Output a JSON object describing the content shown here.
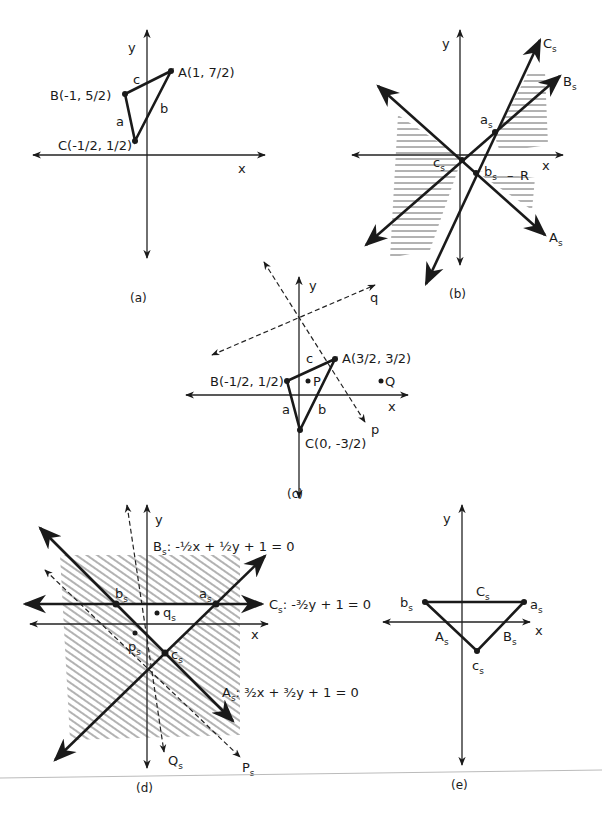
{
  "panels": {
    "a": {
      "caption": "(a)",
      "axis_x": "x",
      "axis_y": "y",
      "points": {
        "A": "A(1, 7/2)",
        "B": "B(-1, 5/2)",
        "C": "C(-1/2, 1/2)"
      },
      "sides": {
        "a": "a",
        "b": "b",
        "c": "c"
      }
    },
    "b": {
      "caption": "(b)",
      "axis_x": "x",
      "axis_y": "y",
      "lines": {
        "As": "A",
        "Bs": "B",
        "Cs": "C",
        "sub": "s"
      },
      "points": {
        "as": "a",
        "bs": "b",
        "cs": "c",
        "sub": "s"
      },
      "region": "R"
    },
    "c": {
      "caption": "(c)",
      "axis_x": "x",
      "axis_y": "y",
      "points": {
        "A": "A(3/2, 3/2)",
        "B": "B(-1/2, 1/2)",
        "C": "C(0, -3/2)",
        "P": "P",
        "Q": "Q"
      },
      "sides": {
        "a": "a",
        "b": "b",
        "c": "c"
      },
      "dashed_lines": {
        "p": "p",
        "q": "q"
      }
    },
    "d": {
      "caption": "(d)",
      "axis_x": "x",
      "axis_y": "y",
      "equations": {
        "Bs": "-½x + ½y + 1 = 0",
        "Cs": "-³⁄₂y + 1 = 0",
        "As": "³⁄₂x + ³⁄₂y + 1 = 0"
      },
      "lines": {
        "As": "A",
        "Bs": "B",
        "Cs": "C",
        "Ps": "P",
        "Qs": "Q",
        "sub": "s"
      },
      "points": {
        "as": "a",
        "bs": "b",
        "cs": "c",
        "ps": "p",
        "qs": "q",
        "sub": "s"
      }
    },
    "e": {
      "caption": "(e)",
      "axis_x": "x",
      "axis_y": "y",
      "sides": {
        "As": "A",
        "Bs": "B",
        "Cs": "C",
        "sub": "s"
      },
      "points": {
        "as": "a",
        "bs": "b",
        "cs": "c",
        "sub": "s"
      }
    }
  }
}
